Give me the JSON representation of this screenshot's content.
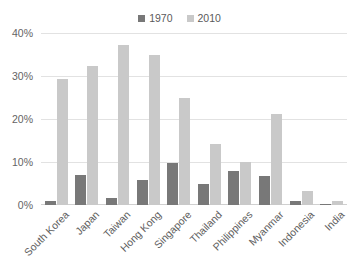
{
  "chart_data": {
    "type": "bar",
    "title": "",
    "subtitle": "",
    "xlabel": "",
    "ylabel": "",
    "ylim": [
      0,
      40
    ],
    "ytick_labels": [
      "0%",
      "10%",
      "20%",
      "30%",
      "40%"
    ],
    "ytick_values": [
      0,
      10,
      20,
      30,
      40
    ],
    "grid": true,
    "legend_position": "top-center",
    "categories": [
      "South Korea",
      "Japan",
      "Taiwan",
      "Hong Kong",
      "Singapore",
      "Thailand",
      "Philippines",
      "Myanmar",
      "Indonesia",
      "India"
    ],
    "series": [
      {
        "name": "1970",
        "color": "#787878",
        "values": [
          1.0,
          7.0,
          1.7,
          5.8,
          9.8,
          4.9,
          7.8,
          6.7,
          1.0,
          0.3
        ]
      },
      {
        "name": "2010",
        "color": "#c9c9c9",
        "values": [
          29.2,
          32.3,
          37.3,
          34.8,
          24.8,
          14.3,
          10.1,
          21.2,
          3.2,
          1.0
        ]
      }
    ]
  },
  "legend": {
    "entries": [
      {
        "label": "1970"
      },
      {
        "label": "2010"
      }
    ]
  },
  "colors": {
    "series_1970": "#787878",
    "series_2010": "#c9c9c9",
    "gridline": "#e2e2e2",
    "text": "#5e5e5e",
    "background": "#ffffff"
  }
}
